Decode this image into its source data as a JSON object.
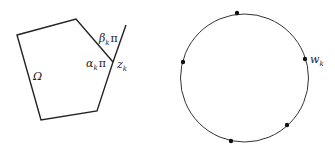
{
  "left_figure": {
    "description": "polygon domain",
    "region_label": "Ω",
    "vertex_label": "z",
    "vertex_sub": "k",
    "interior_angle": {
      "sym": "α",
      "sub": "k",
      "tail": "π"
    },
    "exterior_angle": {
      "sym": "β",
      "sub": "k",
      "tail": "π"
    },
    "vertices": [
      [
        17,
        35
      ],
      [
        76,
        19
      ],
      [
        113,
        62
      ],
      [
        97,
        111
      ],
      [
        41,
        120
      ]
    ],
    "extension_end": [
      126,
      25
    ]
  },
  "right_figure": {
    "description": "unit circle with prevertices",
    "point_label": "w",
    "point_sub": "k",
    "center": [
      244.5,
      78
    ],
    "radius": 64,
    "points": [
      [
        237,
        13
      ],
      [
        183,
        62
      ],
      [
        305,
        59
      ],
      [
        231,
        141
      ],
      [
        287,
        125
      ]
    ]
  },
  "colors": {
    "stroke": "#222222",
    "background": "#ffffff"
  }
}
